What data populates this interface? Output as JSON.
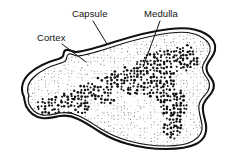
{
  "figure": {
    "background_color": "#ffffff",
    "line_color": "#111111",
    "width": 236,
    "height": 168
  },
  "labels": [
    {
      "id": "cortex",
      "text": "Cortex",
      "text_x": 37,
      "text_y": 41,
      "leader_from_x": 62,
      "leader_from_y": 44,
      "leader_to_x": 86,
      "leader_to_y": 62
    },
    {
      "id": "capsule",
      "text": "Capsule",
      "text_x": 72,
      "text_y": 17,
      "leader_from_x": 93,
      "leader_from_y": 21,
      "leader_to_x": 107,
      "leader_to_y": 44
    },
    {
      "id": "medulla",
      "text": "Medulla",
      "text_x": 144,
      "text_y": 17,
      "leader_from_x": 160,
      "leader_from_y": 21,
      "leader_to_x": 143,
      "leader_to_y": 67
    }
  ],
  "anatomy": {
    "capsule_outer_path": "M 24 97 C 20 89 22 80 30 73 C 38 66 48 62 55 60 C 59 59 62 58 63 56 C 64 54 63 51 66 50 C 69 49 72 52 76 52 C 86 51 99 47 114 42 C 133 36 152 31 170 29 C 186 27 198 29 206 34 C 213 38 216 44 215 50 C 214 56 209 60 207 65 C 205 70 208 74 211 78 C 214 82 215 87 212 92 C 209 97 204 100 203 106 C 202 112 205 118 206 125 C 207 133 204 140 196 144 C 188 148 177 149 166 149 C 152 149 139 147 128 144 C 117 141 108 137 100 132 C 92 127 85 122 78 119 C 72 116 66 115 60 116 C 54 117 48 119 42 118 C 35 117 29 112 26 106 C 25 102 24 99 24 97 Z",
    "capsule_inner_path": "M 29 96 C 26 89 28 82 35 76 C 42 70 51 66 58 64 C 62 63 65 62 66 60 C 67 58 66 55 69 54 C 72 53 74 56 78 56 C 88 55 100 51 115 46 C 134 40 152 35 170 33 C 185 31 196 33 203 38 C 209 42 211 46 210 51 C 209 56 205 60 203 65 C 201 70 204 74 207 78 C 210 82 210 87 208 91 C 205 96 200 99 199 105 C 198 111 201 118 202 125 C 203 132 200 137 193 141 C 186 145 176 146 166 146 C 152 146 140 144 129 141 C 118 138 109 134 101 129 C 93 124 86 119 79 116 C 73 113 66 112 60 113 C 54 114 48 116 42 115 C 36 114 31 109 29 104 C 28 100 28 97 29 96 Z"
  },
  "stipple": {
    "cortex_description": "fine light radial dot rows filling the interior",
    "medulla_description": "dense dark branching dot cluster through the centre and right",
    "dot_color_cortex": "#6f6f6f",
    "dot_color_medulla": "#111111"
  }
}
